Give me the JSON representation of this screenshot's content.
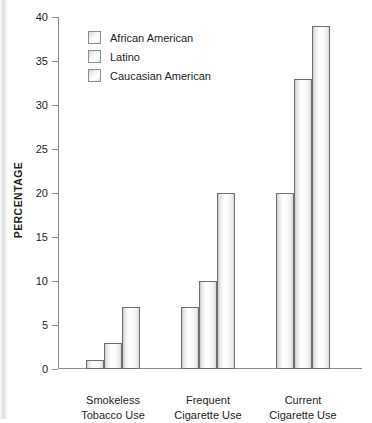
{
  "chart_data": {
    "type": "bar",
    "title": "",
    "xlabel": "",
    "ylabel": "PERCENTAGE",
    "ylim": [
      0,
      40
    ],
    "ytick_interval": 5,
    "yticks": [
      40,
      35,
      30,
      25,
      20,
      15,
      10,
      5,
      0
    ],
    "ytick_labels": [
      "40",
      "35",
      "30",
      "25",
      "20",
      "15",
      "10",
      "5",
      "0"
    ],
    "grid": false,
    "legend_position": "top-left inside plot",
    "categories": [
      "Smokeless Tobacco Use",
      "Frequent Cigarette Use",
      "Current Cigarette Use"
    ],
    "category_lines": [
      [
        "Smokeless",
        "Tobacco Use"
      ],
      [
        "Frequent",
        "Cigarette Use"
      ],
      [
        "Current",
        "Cigarette Use"
      ]
    ],
    "series": [
      {
        "name": "African American",
        "values": [
          1,
          7,
          20
        ]
      },
      {
        "name": "Latino",
        "values": [
          3,
          10,
          33
        ]
      },
      {
        "name": "Caucasian American",
        "values": [
          7,
          20,
          39
        ]
      }
    ],
    "bar_fill_color": "#f2f2f2",
    "bar_border_color": "#6f6f6f",
    "axis_color": "#8a8a8a",
    "text_color": "#231f20"
  },
  "legend": {
    "items": [
      {
        "label": "African American",
        "swatch_name": "legend-swatch-african-american"
      },
      {
        "label": "Latino",
        "swatch_name": "legend-swatch-latino"
      },
      {
        "label": "Caucasian American",
        "swatch_name": "legend-swatch-caucasian-american"
      }
    ]
  },
  "axis": {
    "y_title": "PERCENTAGE"
  }
}
